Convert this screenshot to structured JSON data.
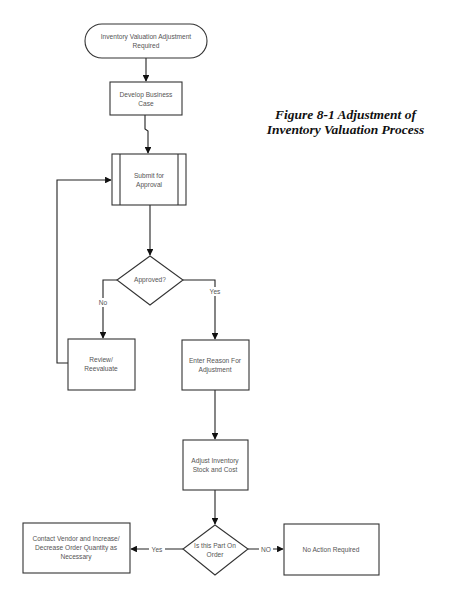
{
  "figure": {
    "caption_line1": "Figure 8-1  Adjustment of",
    "caption_line2": "Inventory Valuation Process"
  },
  "nodes": {
    "start": {
      "type": "terminator",
      "lines": [
        "Inventory Valuation Adjustment",
        "Required"
      ]
    },
    "develop": {
      "type": "process",
      "lines": [
        "Develop Business",
        "Case"
      ]
    },
    "submit": {
      "type": "predefined-process",
      "lines": [
        "Submit for",
        "Approval"
      ]
    },
    "approved": {
      "type": "decision",
      "lines": [
        "Approved?"
      ]
    },
    "review": {
      "type": "process",
      "lines": [
        "Review/",
        "Reevaluate"
      ]
    },
    "enter_reason": {
      "type": "process",
      "lines": [
        "Enter Reason For",
        "Adjustment"
      ]
    },
    "adjust": {
      "type": "process",
      "lines": [
        "Adjust Inventory",
        "Stock and Cost"
      ]
    },
    "on_order": {
      "type": "decision",
      "lines": [
        "Is this Part On",
        "Order"
      ]
    },
    "contact_vendor": {
      "type": "process",
      "lines": [
        "Contact Vendor and Increase/",
        "Decrease Order Quantity as",
        "Necessary"
      ]
    },
    "no_action": {
      "type": "process",
      "lines": [
        "No Action Required"
      ]
    }
  },
  "edges": {
    "approved_no": "No",
    "approved_yes": "Yes",
    "on_order_yes": "Yes",
    "on_order_no": "NO"
  },
  "colors": {
    "stroke": "#333333",
    "text": "#555555",
    "caption": "#111111",
    "background": "#ffffff"
  }
}
